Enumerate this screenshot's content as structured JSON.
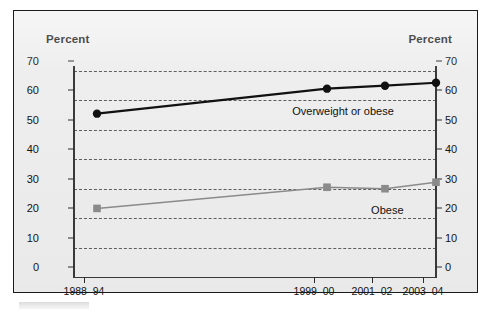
{
  "chart_data": {
    "type": "line",
    "title": "",
    "ylabel_left": "Percent",
    "ylabel_right": "Percent",
    "xlabel": "",
    "categories": [
      "1988–94",
      "1999–00",
      "2001–02",
      "2003–04"
    ],
    "ylim": [
      0,
      70
    ],
    "yticks": [
      0,
      10,
      20,
      30,
      40,
      50,
      60,
      70
    ],
    "grid": "horizontal-dashed",
    "legend": "inline-annotations",
    "series": [
      {
        "name": "Overweight or obese",
        "values": [
          55.5,
          64.0,
          65.0,
          66.0
        ],
        "color": "#111111",
        "marker": "circle"
      },
      {
        "name": "Obese",
        "values": [
          23.3,
          30.5,
          30.0,
          32.2
        ],
        "color": "#8c8c8c",
        "marker": "square"
      }
    ],
    "annotations": [
      {
        "text": "Overweight or obese",
        "x_category_index": 1.5,
        "y_value": 55.0
      },
      {
        "text": "Obese",
        "x_category_index": 2.3,
        "y_value": 21.5
      }
    ]
  },
  "axis": {
    "left_title": "Percent",
    "right_title": "Percent",
    "tick_labels": [
      "70",
      "60",
      "50",
      "40",
      "30",
      "20",
      "10",
      "0"
    ],
    "x_labels": [
      "1988–94",
      "1999–00",
      "2001–02",
      "2003–04"
    ]
  },
  "colors": {
    "frame_border": "#1b1b1b",
    "plot_background": "#eeeeee",
    "gridline": "#5e5e5e",
    "series_overweight": "#111111",
    "series_obese": "#8c8c8c",
    "text": "#141414"
  }
}
